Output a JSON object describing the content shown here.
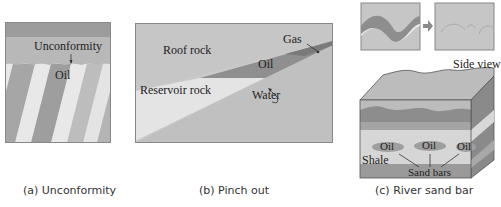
{
  "panels": [
    {
      "id": "a",
      "caption": "(a) Unconformity",
      "labels": {
        "unconformity": "Unconformity",
        "oil": "Oil"
      }
    },
    {
      "id": "b",
      "caption": "(b) Pinch out",
      "labels": {
        "roof_rock": "Roof rock",
        "gas": "Gas",
        "oil": "Oil",
        "reservoir_rock": "Reservoir rock",
        "water": "Water"
      }
    },
    {
      "id": "c",
      "caption": "(c) River sand bar",
      "labels": {
        "side_view": "Side view",
        "oil_1": "Oil",
        "oil_2": "Oil",
        "oil_3": "Oil",
        "shale": "Shale",
        "sand_bars": "Sand bars"
      }
    }
  ],
  "colors": {
    "dark_gray": "#8c8c8c",
    "mid_gray": "#a9a9a9",
    "light_gray": "#c4c4c4",
    "pale": "#e6e6e6",
    "frame": "#888888"
  }
}
